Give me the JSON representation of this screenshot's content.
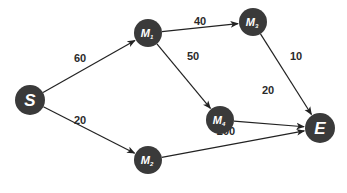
{
  "graph": {
    "nodes": [
      {
        "id": "S",
        "label": "S",
        "sub": "",
        "x": 30,
        "y": 100,
        "r": 15
      },
      {
        "id": "M1",
        "label": "M",
        "sub": "1",
        "x": 148,
        "y": 33,
        "r": 14
      },
      {
        "id": "M3",
        "label": "M",
        "sub": "3",
        "x": 253,
        "y": 22,
        "r": 14
      },
      {
        "id": "M4",
        "label": "M",
        "sub": "4",
        "x": 220,
        "y": 120,
        "r": 14
      },
      {
        "id": "M2",
        "label": "M",
        "sub": "2",
        "x": 148,
        "y": 160,
        "r": 14
      },
      {
        "id": "E",
        "label": "E",
        "sub": "",
        "x": 320,
        "y": 128,
        "r": 15
      }
    ],
    "edges": [
      {
        "from": "S",
        "to": "M1",
        "weight": "60",
        "lx": 80,
        "ly": 62
      },
      {
        "from": "S",
        "to": "M2",
        "weight": "20",
        "lx": 80,
        "ly": 124
      },
      {
        "from": "M1",
        "to": "M3",
        "weight": "40",
        "lx": 200,
        "ly": 25
      },
      {
        "from": "M1",
        "to": "M4",
        "weight": "50",
        "lx": 193,
        "ly": 60
      },
      {
        "from": "M3",
        "to": "E",
        "weight": "10",
        "lx": 296,
        "ly": 60
      },
      {
        "from": "M4",
        "to": "E",
        "weight": "20",
        "lx": 268,
        "ly": 94
      },
      {
        "from": "M2",
        "to": "E",
        "weight": "200",
        "lx": 226,
        "ly": 135
      }
    ]
  }
}
